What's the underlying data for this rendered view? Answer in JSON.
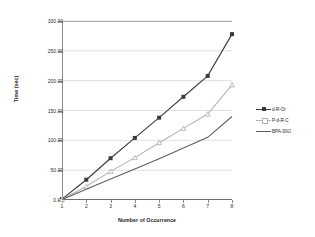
{
  "chart_data": {
    "type": "line",
    "title": "",
    "xlabel": "Number of Occurrence",
    "ylabel": "Time (sec)",
    "x": [
      1,
      2,
      3,
      4,
      5,
      6,
      7,
      8
    ],
    "xticklabels": [
      "1",
      "2",
      "3",
      "4",
      "5",
      "6",
      "7",
      "8"
    ],
    "yticklabels": [
      "0.00",
      "50.00",
      "100.00",
      "150.00",
      "200.00",
      "250.00",
      "300.00"
    ],
    "ytickvalues": [
      0,
      50,
      100,
      150,
      200,
      250,
      300
    ],
    "xlim": [
      1,
      8
    ],
    "ylim": [
      0,
      300
    ],
    "grid": true,
    "legend_position": "right",
    "series": [
      {
        "name": "d-R-Or",
        "color": "#3a3a3a",
        "marker": "square",
        "values": [
          1.5,
          34.0,
          70.0,
          104.0,
          138.0,
          173.0,
          208.0,
          278.0
        ]
      },
      {
        "name": "P-d-R-C",
        "color": "#b3b3b3",
        "marker": "triangle",
        "values": [
          1.0,
          23.0,
          48.0,
          71.0,
          96.0,
          120.0,
          144.0,
          193.0
        ]
      },
      {
        "name": "BPA-SNJ",
        "color": "#5e5e5e",
        "marker": "none",
        "values": [
          1.0,
          18.0,
          35.0,
          52.0,
          69.0,
          87.0,
          105.0,
          140.0
        ]
      }
    ]
  },
  "axes": {
    "y_title": "Time (sec)",
    "x_title": "Number of Occurrence"
  }
}
